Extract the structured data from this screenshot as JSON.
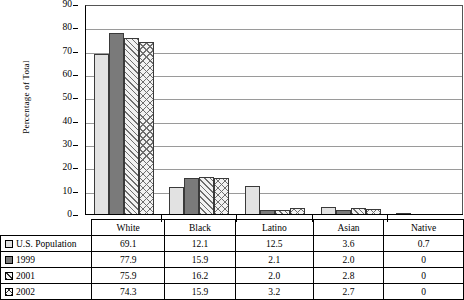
{
  "chart_data": {
    "type": "bar",
    "title": "",
    "xlabel": "",
    "ylabel": "Percentage of Total",
    "ylim": [
      0,
      90
    ],
    "ytick_step": 10,
    "yticks": [
      "90",
      "80",
      "70",
      "60",
      "50",
      "40",
      "30",
      "20",
      "10",
      "0"
    ],
    "grid": true,
    "legend_position": "table-row-headers",
    "categories": [
      "White",
      "Black",
      "Latino",
      "Asian",
      "Native"
    ],
    "series": [
      {
        "name": "U.S. Population",
        "pattern": "solid-light",
        "values": [
          69.1,
          12.1,
          12.5,
          3.6,
          0.7
        ]
      },
      {
        "name": "1999",
        "pattern": "solid-dark",
        "values": [
          77.9,
          15.9,
          2.1,
          2.0,
          0
        ]
      },
      {
        "name": "2001",
        "pattern": "diagonal",
        "values": [
          75.9,
          16.2,
          2.0,
          2.8,
          0
        ]
      },
      {
        "name": "2002",
        "pattern": "crosshatch",
        "values": [
          74.3,
          15.9,
          3.2,
          2.7,
          0
        ]
      }
    ]
  },
  "table": {
    "corner_label": "",
    "column_headers": [
      "White",
      "Black",
      "Latino",
      "Asian",
      "Native"
    ],
    "rows": [
      {
        "label": "U.S. Population",
        "swatch": "solid-light",
        "cells": [
          "69.1",
          "12.1",
          "12.5",
          "3.6",
          "0.7"
        ]
      },
      {
        "label": "1999",
        "swatch": "solid-dark",
        "cells": [
          "77.9",
          "15.9",
          "2.1",
          "2.0",
          "0"
        ]
      },
      {
        "label": "2001",
        "swatch": "diagonal",
        "cells": [
          "75.9",
          "16.2",
          "2.0",
          "2.8",
          "0"
        ]
      },
      {
        "label": "2002",
        "swatch": "crosshatch",
        "cells": [
          "74.3",
          "15.9",
          "3.2",
          "2.7",
          "0"
        ]
      }
    ]
  },
  "colors": {
    "series_light": "#e2e2e2",
    "series_dark": "#7a7a7a",
    "hatch": "#6e6e6e",
    "axis": "#000000",
    "gridline": "#9a9a9a"
  }
}
